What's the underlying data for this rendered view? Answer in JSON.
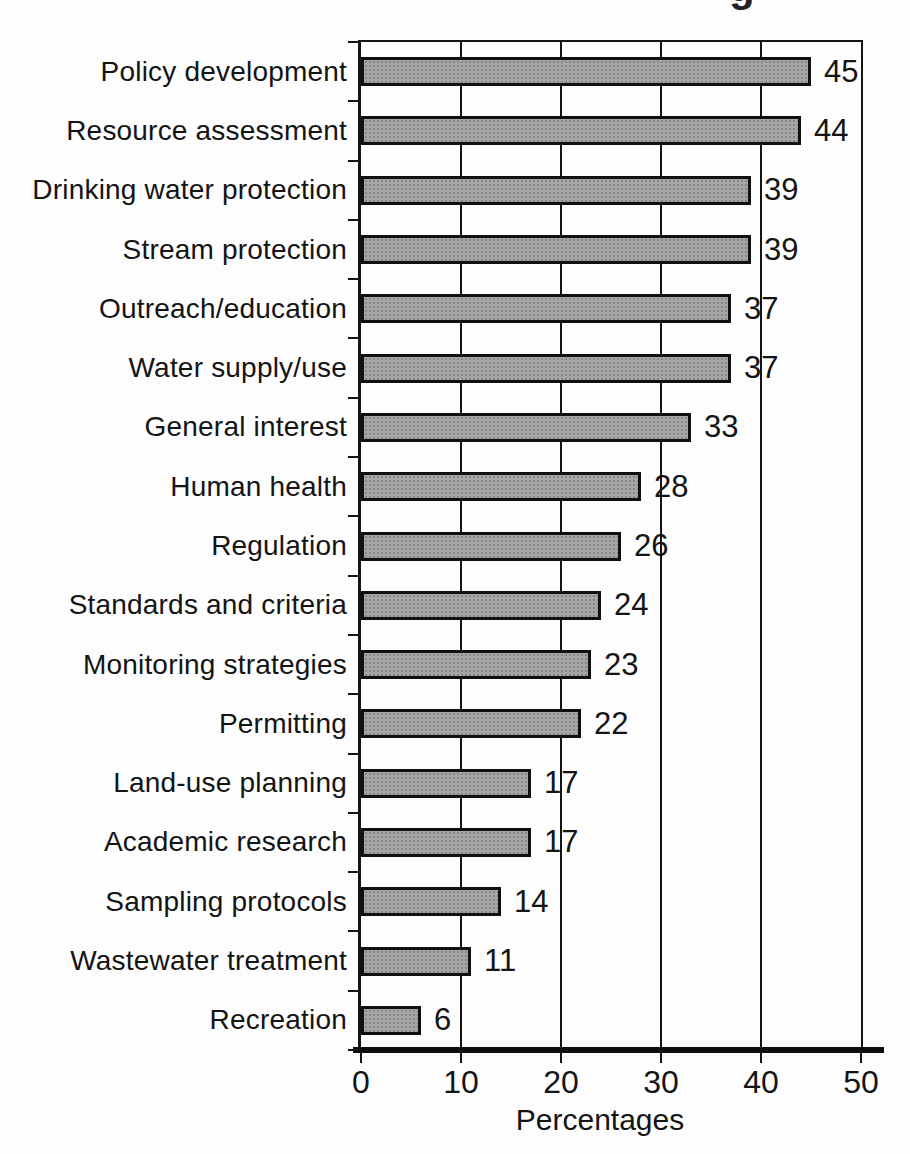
{
  "figure": {
    "title_fragment": "g",
    "background_color": "#fdfdfd",
    "line_color": "#141414"
  },
  "chart_data": {
    "type": "bar",
    "orientation": "horizontal",
    "title": "",
    "xlabel": "Percentages",
    "ylabel": "",
    "categories": [
      "Policy development",
      "Resource assessment",
      "Drinking water protection",
      "Stream protection",
      "Outreach/education",
      "Water supply/use",
      "General interest",
      "Human health",
      "Regulation",
      "Standards and criteria",
      "Monitoring strategies",
      "Permitting",
      "Land-use planning",
      "Academic research",
      "Sampling protocols",
      "Wastewater treatment",
      "Recreation"
    ],
    "values": [
      45,
      44,
      39,
      39,
      37,
      37,
      33,
      28,
      26,
      24,
      23,
      22,
      17,
      17,
      14,
      11,
      6
    ],
    "xlim": [
      0,
      50
    ],
    "xticks": [
      0,
      10,
      20,
      30,
      40,
      50
    ],
    "grid": "vertical",
    "value_labels": true,
    "legend": "none",
    "bar_color": "#a6a6a6",
    "bar_border_color": "#101010"
  }
}
